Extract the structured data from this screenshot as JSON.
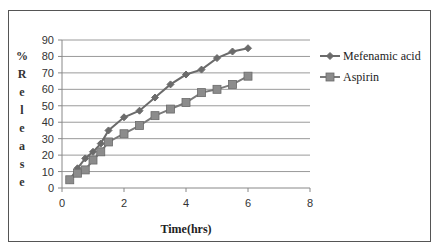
{
  "chart_data": {
    "type": "line",
    "title": "",
    "xlabel": "Time(hrs)",
    "ylabel": "% Release",
    "xlim": [
      0,
      8
    ],
    "ylim": [
      0,
      90
    ],
    "x_ticks": [
      "0",
      "2",
      "4",
      "6",
      "8"
    ],
    "y_ticks": [
      "0",
      "10",
      "20",
      "30",
      "40",
      "50",
      "60",
      "70",
      "80",
      "90"
    ],
    "grid": true,
    "legend_position": "right",
    "x": [
      0.25,
      0.5,
      0.75,
      1,
      1.25,
      1.5,
      2,
      2.5,
      3,
      3.5,
      4,
      4.5,
      5,
      5.5,
      6
    ],
    "series": [
      {
        "name": "Mefenamic acid",
        "marker": "diamond",
        "color": "#6b6b6b",
        "values": [
          5,
          12,
          18,
          22,
          27,
          35,
          43,
          47,
          55,
          63,
          69,
          72,
          79,
          83,
          85
        ]
      },
      {
        "name": "Aspirin",
        "marker": "square",
        "color": "#7a7a7a",
        "values": [
          5,
          9,
          11,
          17,
          22,
          28,
          33,
          38,
          44,
          48,
          52,
          58,
          60,
          63,
          68
        ]
      }
    ]
  },
  "ylabel_chars": [
    "%",
    "R",
    "e",
    "l",
    "e",
    "a",
    "s",
    "e"
  ]
}
